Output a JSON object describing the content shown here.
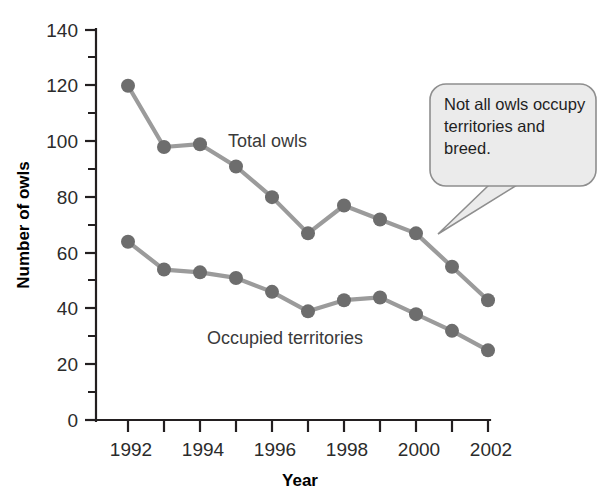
{
  "chart_data": {
    "type": "line",
    "title": "",
    "xlabel": "Year",
    "ylabel": "Number of owls",
    "x": [
      1992,
      1993,
      1994,
      1995,
      1996,
      1997,
      1998,
      1999,
      2000,
      2001,
      2002
    ],
    "xlim": [
      1991.5,
      2002.5
    ],
    "ylim": [
      0,
      140
    ],
    "ytick_major": [
      0,
      20,
      40,
      60,
      80,
      100,
      120,
      140
    ],
    "ytick_minor": [
      10,
      30,
      50,
      70,
      90,
      110,
      130
    ],
    "xtick_all": [
      1992,
      1993,
      1994,
      1995,
      1996,
      1997,
      1998,
      1999,
      2000,
      2001,
      2002
    ],
    "xtick_labeled": [
      "1992",
      "",
      "1994",
      "",
      "1996",
      "",
      "1998",
      "",
      "2000",
      "",
      "2002"
    ],
    "grid": false,
    "legend": "inline-labels",
    "series": [
      {
        "name": "Total owls",
        "label": "Total owls",
        "color": "#6d6d6d",
        "line_color": "#9b9b9b",
        "values": [
          120,
          98,
          99,
          91,
          80,
          67,
          77,
          72,
          67,
          55,
          43
        ]
      },
      {
        "name": "Occupied territories",
        "label": "Occupied territories",
        "color": "#6d6d6d",
        "line_color": "#9b9b9b",
        "values": [
          64,
          54,
          53,
          51,
          46,
          39,
          43,
          44,
          38,
          32,
          25
        ]
      }
    ],
    "annotations": [
      {
        "name": "callout",
        "lines": [
          "Not all owls occupy",
          "territories and",
          "breed."
        ],
        "points_to": {
          "x": 2000,
          "y": 67,
          "series": "Total owls"
        },
        "fill": "#ebebeb",
        "border": "#8e8e8e"
      }
    ]
  },
  "labels": {
    "y_axis_title": "Number of owls",
    "x_axis_title": "Year",
    "series_total": "Total owls",
    "series_occupied": "Occupied territories",
    "callout_line_1": "Not all owls occupy",
    "callout_line_2": "territories and",
    "callout_line_3": "breed."
  },
  "ytick_text": [
    "0",
    "20",
    "40",
    "60",
    "80",
    "100",
    "120",
    "140"
  ],
  "xtick_text": [
    "1992",
    "1994",
    "1996",
    "1998",
    "2000",
    "2002"
  ]
}
